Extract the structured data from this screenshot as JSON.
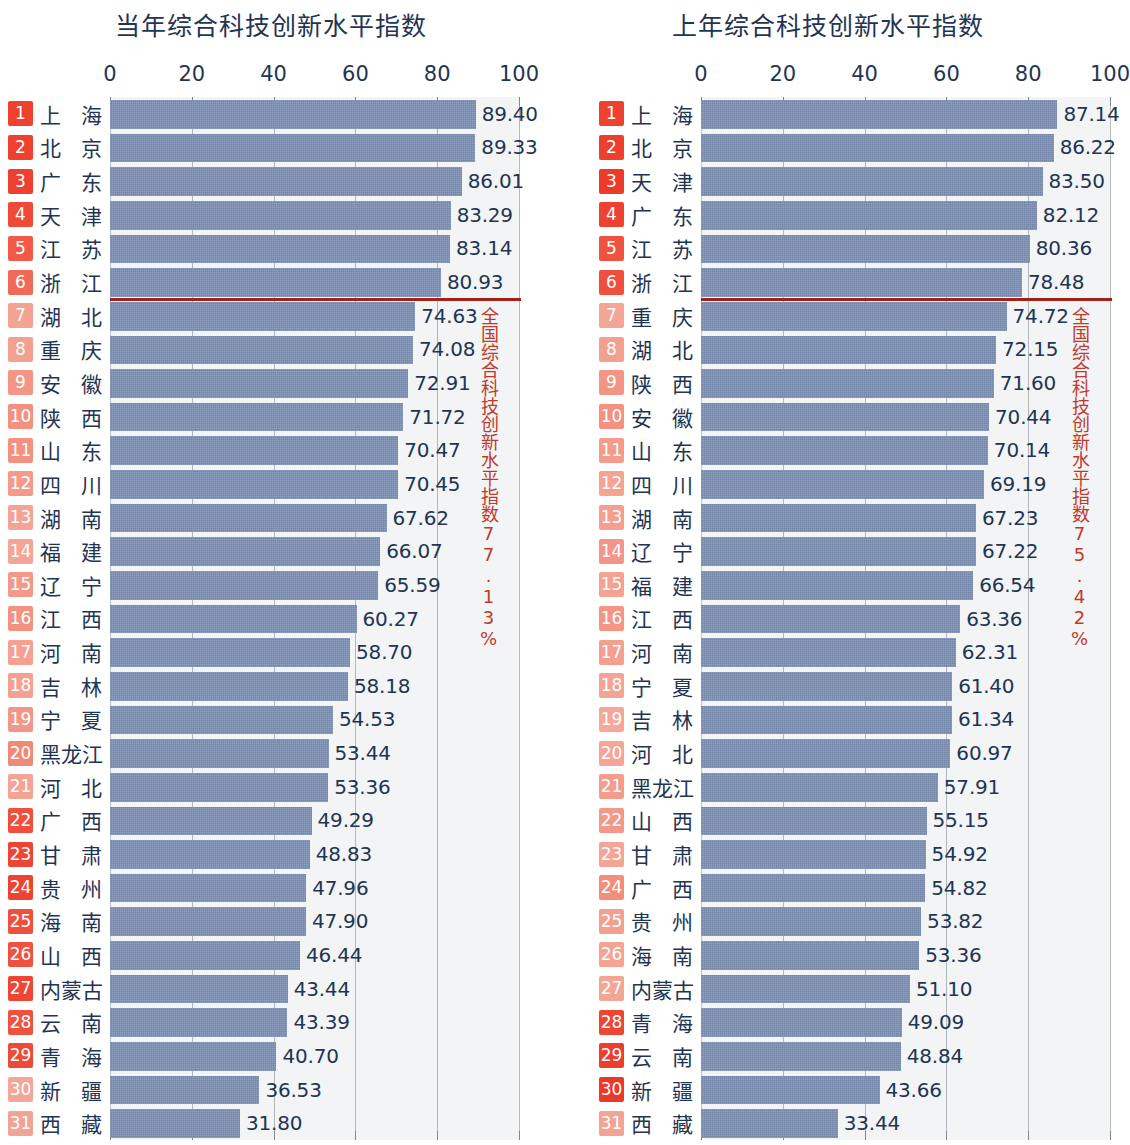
{
  "colors": {
    "bar": "#7d90b4",
    "plot_bg": "#f2f4f5",
    "text": "#1f3553",
    "badge_strong": "#ef4130",
    "badge_light": "#f5a595",
    "avg_line": "#a32218",
    "avg_text": "#c0392b",
    "gridline": "#9aa3ac"
  },
  "axis": {
    "ticks": [
      "0",
      "20",
      "40",
      "60",
      "80",
      "100"
    ],
    "min": 0,
    "max": 100
  },
  "charts": [
    {
      "id": "current-year",
      "title": "当年综合科技创新水平指数",
      "average_note": "全国综合科技创新水平指数77.13%",
      "average_value": 77.13,
      "average_after_rank": 6,
      "rows": [
        {
          "rank": "1",
          "province": "上海",
          "value": "89.40",
          "badge": "#ef4130"
        },
        {
          "rank": "2",
          "province": "北京",
          "value": "89.33",
          "badge": "#ef4130"
        },
        {
          "rank": "3",
          "province": "广东",
          "value": "86.01",
          "badge": "#ee4030"
        },
        {
          "rank": "4",
          "province": "天津",
          "value": "83.29",
          "badge": "#ef4a38"
        },
        {
          "rank": "5",
          "province": "江苏",
          "value": "83.14",
          "badge": "#f05a46"
        },
        {
          "rank": "6",
          "province": "浙江",
          "value": "80.93",
          "badge": "#f06b57"
        },
        {
          "rank": "7",
          "province": "湖北",
          "value": "74.63",
          "badge": "#f4a292"
        },
        {
          "rank": "8",
          "province": "重庆",
          "value": "74.08",
          "badge": "#f3a090"
        },
        {
          "rank": "9",
          "province": "安徽",
          "value": "72.91",
          "badge": "#f49585"
        },
        {
          "rank": "10",
          "province": "陕西",
          "value": "71.72",
          "badge": "#f39080"
        },
        {
          "rank": "11",
          "province": "山东",
          "value": "70.47",
          "badge": "#f49181"
        },
        {
          "rank": "12",
          "province": "四川",
          "value": "70.45",
          "badge": "#f59a8a"
        },
        {
          "rank": "13",
          "province": "湖南",
          "value": "67.62",
          "badge": "#f5a394"
        },
        {
          "rank": "14",
          "province": "福建",
          "value": "66.07",
          "badge": "#f5a595"
        },
        {
          "rank": "15",
          "province": "辽宁",
          "value": "65.59",
          "badge": "#f4998a"
        },
        {
          "rank": "16",
          "province": "江西",
          "value": "60.27",
          "badge": "#f39182"
        },
        {
          "rank": "17",
          "province": "河南",
          "value": "58.70",
          "badge": "#f5a091"
        },
        {
          "rank": "18",
          "province": "吉林",
          "value": "58.18",
          "badge": "#f4a192"
        },
        {
          "rank": "19",
          "province": "宁夏",
          "value": "54.53",
          "badge": "#f3968a"
        },
        {
          "rank": "20",
          "province": "黑龙江",
          "value": "53.44",
          "badge": "#f08a78"
        },
        {
          "rank": "21",
          "province": "河北",
          "value": "53.36",
          "badge": "#f4a494"
        },
        {
          "rank": "22",
          "province": "广西",
          "value": "49.29",
          "badge": "#ef4f3c"
        },
        {
          "rank": "23",
          "province": "甘肃",
          "value": "48.83",
          "badge": "#ee4433"
        },
        {
          "rank": "24",
          "province": "贵州",
          "value": "47.96",
          "badge": "#ee4332"
        },
        {
          "rank": "25",
          "province": "海南",
          "value": "47.90",
          "badge": "#ef4f3d"
        },
        {
          "rank": "26",
          "province": "山西",
          "value": "46.44",
          "badge": "#ef5340"
        },
        {
          "rank": "27",
          "province": "内蒙古",
          "value": "43.44",
          "badge": "#ee4635"
        },
        {
          "rank": "28",
          "province": "云南",
          "value": "43.39",
          "badge": "#ef5340"
        },
        {
          "rank": "29",
          "province": "青海",
          "value": "40.70",
          "badge": "#ee4a38"
        },
        {
          "rank": "30",
          "province": "新疆",
          "value": "36.53",
          "badge": "#f3a798"
        },
        {
          "rank": "31",
          "province": "西藏",
          "value": "31.80",
          "badge": "#f3a393"
        }
      ]
    },
    {
      "id": "previous-year",
      "title": "上年综合科技创新水平指数",
      "average_note": "全国综合科技创新水平指数75.42%",
      "average_value": 75.42,
      "average_after_rank": 6,
      "rows": [
        {
          "rank": "1",
          "province": "上海",
          "value": "87.14",
          "badge": "#ef4130"
        },
        {
          "rank": "2",
          "province": "北京",
          "value": "86.22",
          "badge": "#ee3f2e"
        },
        {
          "rank": "3",
          "province": "天津",
          "value": "83.50",
          "badge": "#ed3b2a"
        },
        {
          "rank": "4",
          "province": "广东",
          "value": "82.12",
          "badge": "#ee4231"
        },
        {
          "rank": "5",
          "province": "江苏",
          "value": "80.36",
          "badge": "#ef5340"
        },
        {
          "rank": "6",
          "province": "浙江",
          "value": "78.48",
          "badge": "#ef4f3c"
        },
        {
          "rank": "7",
          "province": "重庆",
          "value": "74.72",
          "badge": "#f4a595"
        },
        {
          "rank": "8",
          "province": "湖北",
          "value": "72.15",
          "badge": "#f3a090"
        },
        {
          "rank": "9",
          "province": "陕西",
          "value": "71.60",
          "badge": "#f39484"
        },
        {
          "rank": "10",
          "province": "安徽",
          "value": "70.44",
          "badge": "#f49181"
        },
        {
          "rank": "11",
          "province": "山东",
          "value": "70.14",
          "badge": "#f59b8b"
        },
        {
          "rank": "12",
          "province": "四川",
          "value": "69.19",
          "badge": "#f5a393"
        },
        {
          "rank": "13",
          "province": "湖南",
          "value": "67.23",
          "badge": "#f4a090"
        },
        {
          "rank": "14",
          "province": "辽宁",
          "value": "67.22",
          "badge": "#f3968a"
        },
        {
          "rank": "15",
          "province": "福建",
          "value": "66.54",
          "badge": "#f4a393"
        },
        {
          "rank": "16",
          "province": "江西",
          "value": "63.36",
          "badge": "#f49585"
        },
        {
          "rank": "17",
          "province": "河南",
          "value": "62.31",
          "badge": "#f4a090"
        },
        {
          "rank": "18",
          "province": "宁夏",
          "value": "61.40",
          "badge": "#f4a494"
        },
        {
          "rank": "19",
          "province": "吉林",
          "value": "61.34",
          "badge": "#f5a898"
        },
        {
          "rank": "20",
          "province": "河北",
          "value": "60.97",
          "badge": "#f5a696"
        },
        {
          "rank": "21",
          "province": "黑龙江",
          "value": "57.91",
          "badge": "#f59c8c"
        },
        {
          "rank": "22",
          "province": "山西",
          "value": "55.15",
          "badge": "#f4998a"
        },
        {
          "rank": "23",
          "province": "甘肃",
          "value": "54.92",
          "badge": "#f5a595"
        },
        {
          "rank": "24",
          "province": "广西",
          "value": "54.82",
          "badge": "#f28e7c"
        },
        {
          "rank": "25",
          "province": "贵州",
          "value": "53.82",
          "badge": "#f4a090"
        },
        {
          "rank": "26",
          "province": "海南",
          "value": "53.36",
          "badge": "#f5a494"
        },
        {
          "rank": "27",
          "province": "内蒙古",
          "value": "51.10",
          "badge": "#f4a696"
        },
        {
          "rank": "28",
          "province": "青海",
          "value": "49.09",
          "badge": "#ee4634"
        },
        {
          "rank": "29",
          "province": "云南",
          "value": "48.84",
          "badge": "#ed3d2c"
        },
        {
          "rank": "30",
          "province": "新疆",
          "value": "43.66",
          "badge": "#ec3828"
        },
        {
          "rank": "31",
          "province": "西藏",
          "value": "33.44",
          "badge": "#f3a494"
        }
      ]
    }
  ],
  "chart_data": [
    {
      "type": "bar",
      "orientation": "horizontal",
      "title": "当年综合科技创新水平指数",
      "xlabel": "",
      "ylabel": "",
      "xlim": [
        0,
        100
      ],
      "xticks": [
        0,
        20,
        40,
        60,
        80,
        100
      ],
      "grid": true,
      "legend": null,
      "categories": [
        "上海",
        "北京",
        "广东",
        "天津",
        "江苏",
        "浙江",
        "湖北",
        "重庆",
        "安徽",
        "陕西",
        "山东",
        "四川",
        "湖南",
        "福建",
        "辽宁",
        "江西",
        "河南",
        "吉林",
        "宁夏",
        "黑龙江",
        "河北",
        "广西",
        "甘肃",
        "贵州",
        "海南",
        "山西",
        "内蒙古",
        "云南",
        "青海",
        "新疆",
        "西藏"
      ],
      "values": [
        89.4,
        89.33,
        86.01,
        83.29,
        83.14,
        80.93,
        74.63,
        74.08,
        72.91,
        71.72,
        70.47,
        70.45,
        67.62,
        66.07,
        65.59,
        60.27,
        58.7,
        58.18,
        54.53,
        53.44,
        53.36,
        49.29,
        48.83,
        47.96,
        47.9,
        46.44,
        43.44,
        43.39,
        40.7,
        36.53,
        31.8
      ],
      "annotations": [
        {
          "text": "全国综合科技创新水平指数77.13%",
          "value": 77.13,
          "type": "reference-line",
          "color": "#a32218"
        }
      ]
    },
    {
      "type": "bar",
      "orientation": "horizontal",
      "title": "上年综合科技创新水平指数",
      "xlabel": "",
      "ylabel": "",
      "xlim": [
        0,
        100
      ],
      "xticks": [
        0,
        20,
        40,
        60,
        80,
        100
      ],
      "grid": true,
      "legend": null,
      "categories": [
        "上海",
        "北京",
        "天津",
        "广东",
        "江苏",
        "浙江",
        "重庆",
        "湖北",
        "陕西",
        "安徽",
        "山东",
        "四川",
        "湖南",
        "辽宁",
        "福建",
        "江西",
        "河南",
        "宁夏",
        "吉林",
        "河北",
        "黑龙江",
        "山西",
        "甘肃",
        "广西",
        "贵州",
        "海南",
        "内蒙古",
        "青海",
        "云南",
        "新疆",
        "西藏"
      ],
      "values": [
        87.14,
        86.22,
        83.5,
        82.12,
        80.36,
        78.48,
        74.72,
        72.15,
        71.6,
        70.44,
        70.14,
        69.19,
        67.23,
        67.22,
        66.54,
        63.36,
        62.31,
        61.4,
        61.34,
        60.97,
        57.91,
        55.15,
        54.92,
        54.82,
        53.82,
        53.36,
        51.1,
        49.09,
        48.84,
        43.66,
        33.44
      ],
      "annotations": [
        {
          "text": "全国综合科技创新水平指数75.42%",
          "value": 75.42,
          "type": "reference-line",
          "color": "#a32218"
        }
      ]
    }
  ]
}
